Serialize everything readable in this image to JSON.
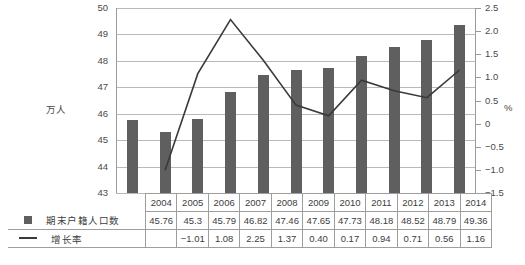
{
  "chart_data": {
    "type": "bar",
    "title": "",
    "subtitle": "",
    "xlabel": "",
    "ylabel": "万人",
    "y2label": "%",
    "categories": [
      "2004",
      "2005",
      "2006",
      "2007",
      "2008",
      "2009",
      "2010",
      "2011",
      "2012",
      "2013",
      "2014"
    ],
    "ylim": [
      43,
      50
    ],
    "y2lim": [
      -1.5,
      2.5
    ],
    "yticks": [
      "50",
      "49",
      "48",
      "47",
      "46",
      "45",
      "44",
      "43"
    ],
    "ytick_values": [
      50,
      49,
      48,
      47,
      46,
      45,
      44,
      43
    ],
    "y2ticks": [
      "2.5",
      "2.0",
      "1.5",
      "1.0",
      "0.5",
      "0",
      "-0.5",
      "-1.0",
      "-1.5"
    ],
    "y2tick_values": [
      2.5,
      2.0,
      1.5,
      1.0,
      0.5,
      0,
      -0.5,
      -1.0,
      -1.5
    ],
    "grid": true,
    "legend_position": "table-below",
    "series": [
      {
        "name": "期末户籍人口数",
        "type": "bar",
        "axis": "left",
        "color": "#5f5f5f",
        "marker": "square",
        "values": [
          45.76,
          45.3,
          45.79,
          46.82,
          47.46,
          47.65,
          47.73,
          48.18,
          48.52,
          48.79,
          49.36
        ],
        "labels": [
          "45.76",
          "45.3",
          "45.79",
          "46.82",
          "47.46",
          "47.65",
          "47.73",
          "48.18",
          "48.52",
          "48.79",
          "49.36"
        ]
      },
      {
        "name": "增长率",
        "type": "line",
        "axis": "right",
        "color": "#3a3a3a",
        "marker": "line",
        "values": [
          null,
          -1.01,
          1.08,
          2.25,
          1.37,
          0.4,
          0.17,
          0.94,
          0.71,
          0.56,
          1.16
        ],
        "labels": [
          "",
          "-1.01",
          "1.08",
          "2.25",
          "1.37",
          "0.40",
          "0.17",
          "0.94",
          "0.71",
          "0.56",
          "1.16"
        ]
      }
    ]
  },
  "table": {
    "header_legend_label": "",
    "years": [
      "2004",
      "2005",
      "2006",
      "2007",
      "2008",
      "2009",
      "2010",
      "2011",
      "2012",
      "2013",
      "2014"
    ],
    "rows": [
      {
        "legend": "期末户籍人口数",
        "marker": "square",
        "cells": [
          "45.76",
          "45.3",
          "45.79",
          "46.82",
          "47.46",
          "47.65",
          "47.73",
          "48.18",
          "48.52",
          "48.79",
          "49.36"
        ]
      },
      {
        "legend": "增长率",
        "marker": "line",
        "cells": [
          "",
          "-1.01",
          "1.08",
          "2.25",
          "1.37",
          "0.40",
          "0.17",
          "0.94",
          "0.71",
          "0.56",
          "1.16"
        ]
      }
    ]
  },
  "axes": {
    "left_title": "万人",
    "right_title": "%"
  },
  "caption": ""
}
